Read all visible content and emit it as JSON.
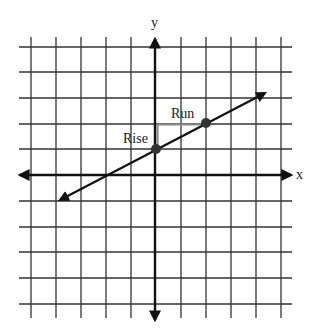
{
  "diagram": {
    "type": "coordinate-plane-slope",
    "axes": {
      "x_label": "x",
      "y_label": "y"
    },
    "grid": {
      "x_lines_px": [
        31,
        56,
        81,
        106,
        131,
        155,
        181,
        206,
        231,
        256,
        281
      ],
      "y_lines_px": [
        47,
        72,
        98,
        124,
        149,
        175,
        201,
        227,
        252,
        278,
        304
      ],
      "origin_px": [
        155,
        175
      ],
      "unit_px": 25
    },
    "line": {
      "start_px": [
        58,
        201
      ],
      "end_px": [
        267,
        92
      ],
      "slope": 0.5,
      "y_intercept": 1
    },
    "points": [
      {
        "name": "y-intercept",
        "x": 0,
        "y": 1,
        "px": [
          156,
          149
        ]
      },
      {
        "name": "second-point",
        "x": 2,
        "y": 2,
        "px": [
          206,
          123
        ]
      }
    ],
    "annotations": {
      "rise_label": "Rise",
      "run_label": "Run"
    },
    "colors": {
      "grid": "#333333",
      "axis": "#111111",
      "line": "#111111",
      "rise_run": "#8a8a8a",
      "point": "#333333"
    }
  }
}
